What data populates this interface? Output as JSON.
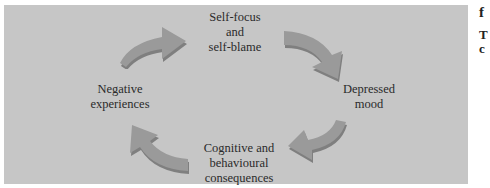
{
  "diagram": {
    "title": "",
    "background_color": "#c6c6c6",
    "arrow_color": "#9a9a9a",
    "arrow_shadow_color": "#7f7f7f",
    "nodes": [
      {
        "id": "self_focus",
        "label_lines": [
          "Self-focus",
          "and",
          "self-blame"
        ]
      },
      {
        "id": "depressed_mood",
        "label_lines": [
          "Depressed",
          "mood"
        ]
      },
      {
        "id": "consequences",
        "label_lines": [
          "Cognitive and",
          "behavioural",
          "consequences"
        ]
      },
      {
        "id": "negative_experiences",
        "label_lines": [
          "Negative",
          "experiences"
        ]
      }
    ],
    "edges": [
      {
        "from": "negative_experiences",
        "to": "self_focus"
      },
      {
        "from": "self_focus",
        "to": "depressed_mood"
      },
      {
        "from": "depressed_mood",
        "to": "consequences"
      },
      {
        "from": "consequences",
        "to": "negative_experiences"
      }
    ]
  },
  "side_text": {
    "line1": "f",
    "line2": "T",
    "line3": "c"
  }
}
